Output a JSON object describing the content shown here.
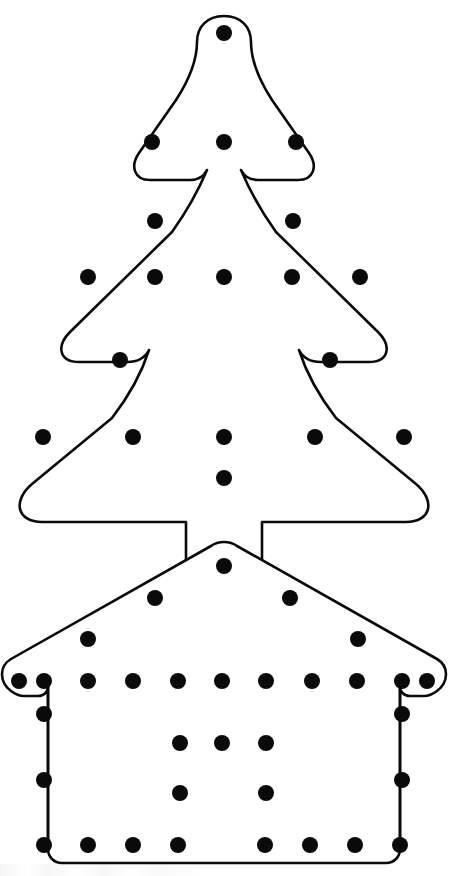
{
  "page": {
    "background_color": "#ffffff",
    "width": 468,
    "height": 876,
    "ink_color": "#0a0a0a",
    "fill_color": "#ffffff"
  },
  "shapes": [
    {
      "id": "christmas-tree",
      "label": "Christmas Tree",
      "stroke_color": "#0a0a0a",
      "fill_color": "#ffffff",
      "stroke_width": 2.6,
      "bounds": {
        "x": 18,
        "y": 14,
        "width": 412,
        "height": 482
      },
      "outline_path": "M 224 15 C 238 15 248 24 248 38 C 248 52 255 68 268 88 L 300 134 C 307 144 304 156 292 156 L 248 156 C 242 156 238 152 238 148 C 238 152 234 156 228 156 L 224 156 L 220 156 C 214 156 210 152 210 148 C 210 152 206 156 200 156 L 156 156 C 144 156 141 144 148 134 L 180 88 C 193 68 200 52 200 38 C 200 24 210 15 224 15 Z",
      "dots": [
        {
          "cx": 224,
          "cy": 33,
          "r": 8,
          "name": "tree-star-peg"
        },
        {
          "cx": 152,
          "cy": 142,
          "r": 8,
          "name": "tree-tier1-left-peg"
        },
        {
          "cx": 224,
          "cy": 142,
          "r": 8,
          "name": "tree-tier1-center-peg"
        },
        {
          "cx": 296,
          "cy": 142,
          "r": 8,
          "name": "tree-tier1-right-peg"
        },
        {
          "cx": 155,
          "cy": 221,
          "r": 8,
          "name": "tree-slope-upper-left-peg"
        },
        {
          "cx": 293,
          "cy": 221,
          "r": 8,
          "name": "tree-slope-upper-right-peg"
        },
        {
          "cx": 88,
          "cy": 277,
          "r": 8,
          "name": "tree-tier2-far-left-peg"
        },
        {
          "cx": 155,
          "cy": 277,
          "r": 8,
          "name": "tree-tier2-left-peg"
        },
        {
          "cx": 224,
          "cy": 277,
          "r": 8,
          "name": "tree-tier2-center-peg"
        },
        {
          "cx": 292,
          "cy": 277,
          "r": 8,
          "name": "tree-tier2-right-peg"
        },
        {
          "cx": 360,
          "cy": 277,
          "r": 8,
          "name": "tree-tier2-far-right-peg"
        },
        {
          "cx": 120,
          "cy": 360,
          "r": 8,
          "name": "tree-slope-lower-left-peg"
        },
        {
          "cx": 330,
          "cy": 360,
          "r": 8,
          "name": "tree-slope-lower-right-peg"
        },
        {
          "cx": 43,
          "cy": 437,
          "r": 8,
          "name": "tree-base-far-left-peg"
        },
        {
          "cx": 133,
          "cy": 437,
          "r": 8,
          "name": "tree-base-left-peg"
        },
        {
          "cx": 224,
          "cy": 437,
          "r": 8,
          "name": "tree-base-center-peg"
        },
        {
          "cx": 315,
          "cy": 437,
          "r": 8,
          "name": "tree-base-right-peg"
        },
        {
          "cx": 404,
          "cy": 437,
          "r": 8,
          "name": "tree-base-far-right-peg"
        },
        {
          "cx": 224,
          "cy": 478,
          "r": 8,
          "name": "tree-trunk-peg"
        }
      ],
      "dot_count": 19
    },
    {
      "id": "house",
      "label": "House",
      "stroke_color": "#0a0a0a",
      "fill_color": "#ffffff",
      "stroke_width": 2.6,
      "bounds": {
        "x": 6,
        "y": 540,
        "width": 443,
        "height": 325
      },
      "dots": [
        {
          "cx": 224,
          "cy": 566,
          "r": 8,
          "name": "house-roof-peak-peg"
        },
        {
          "cx": 155,
          "cy": 598,
          "r": 8,
          "name": "house-roof-left-upper-peg"
        },
        {
          "cx": 290,
          "cy": 598,
          "r": 8,
          "name": "house-roof-right-upper-peg"
        },
        {
          "cx": 88,
          "cy": 639,
          "r": 8,
          "name": "house-roof-left-lower-peg"
        },
        {
          "cx": 358,
          "cy": 639,
          "r": 8,
          "name": "house-roof-right-lower-peg"
        },
        {
          "cx": 19,
          "cy": 681,
          "r": 8,
          "name": "house-eave-peg-1"
        },
        {
          "cx": 44,
          "cy": 681,
          "r": 8,
          "name": "house-eave-peg-2"
        },
        {
          "cx": 88,
          "cy": 681,
          "r": 8,
          "name": "house-eave-peg-3"
        },
        {
          "cx": 133,
          "cy": 681,
          "r": 8,
          "name": "house-eave-peg-4"
        },
        {
          "cx": 178,
          "cy": 681,
          "r": 8,
          "name": "house-eave-peg-5"
        },
        {
          "cx": 222,
          "cy": 681,
          "r": 8,
          "name": "house-eave-peg-6"
        },
        {
          "cx": 266,
          "cy": 681,
          "r": 8,
          "name": "house-eave-peg-7"
        },
        {
          "cx": 312,
          "cy": 681,
          "r": 8,
          "name": "house-eave-peg-8"
        },
        {
          "cx": 357,
          "cy": 681,
          "r": 8,
          "name": "house-eave-peg-9"
        },
        {
          "cx": 402,
          "cy": 681,
          "r": 8,
          "name": "house-eave-peg-10"
        },
        {
          "cx": 427,
          "cy": 681,
          "r": 8,
          "name": "house-eave-peg-11"
        },
        {
          "cx": 44,
          "cy": 714,
          "r": 8,
          "name": "house-wall-left-upper-peg"
        },
        {
          "cx": 402,
          "cy": 714,
          "r": 8,
          "name": "house-wall-right-upper-peg"
        },
        {
          "cx": 180,
          "cy": 743,
          "r": 8,
          "name": "house-window-row1-left-peg"
        },
        {
          "cx": 222,
          "cy": 743,
          "r": 8,
          "name": "house-window-row1-center-peg"
        },
        {
          "cx": 266,
          "cy": 743,
          "r": 8,
          "name": "house-window-row1-right-peg"
        },
        {
          "cx": 44,
          "cy": 780,
          "r": 8,
          "name": "house-wall-left-lower-peg"
        },
        {
          "cx": 180,
          "cy": 793,
          "r": 8,
          "name": "house-window-row2-left-peg"
        },
        {
          "cx": 266,
          "cy": 793,
          "r": 8,
          "name": "house-window-row2-right-peg"
        },
        {
          "cx": 402,
          "cy": 780,
          "r": 8,
          "name": "house-wall-right-lower-peg"
        },
        {
          "cx": 44,
          "cy": 845,
          "r": 8,
          "name": "house-floor-peg-1"
        },
        {
          "cx": 88,
          "cy": 845,
          "r": 8,
          "name": "house-floor-peg-2"
        },
        {
          "cx": 133,
          "cy": 845,
          "r": 8,
          "name": "house-floor-peg-3"
        },
        {
          "cx": 178,
          "cy": 845,
          "r": 8,
          "name": "house-floor-peg-4"
        },
        {
          "cx": 265,
          "cy": 845,
          "r": 8,
          "name": "house-floor-peg-5"
        },
        {
          "cx": 310,
          "cy": 845,
          "r": 8,
          "name": "house-floor-peg-6"
        },
        {
          "cx": 355,
          "cy": 845,
          "r": 8,
          "name": "house-floor-peg-7"
        },
        {
          "cx": 400,
          "cy": 845,
          "r": 8,
          "name": "house-floor-peg-8"
        }
      ],
      "dot_count": 33
    }
  ]
}
